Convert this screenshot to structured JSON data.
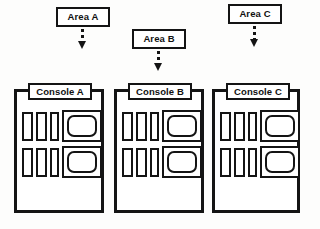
{
  "figure": {
    "kind": "block-diagram",
    "ink_color": "#141414",
    "paper_color": "#fdfdfc"
  },
  "areas": [
    {
      "id": "area-a",
      "label": "Area A",
      "box": {
        "x": 56,
        "y": 7,
        "w": 54,
        "h": 20
      },
      "arrow": {
        "x": 78,
        "y": 29,
        "stem_h": 12,
        "icon": "dashed-down-arrow-icon"
      }
    },
    {
      "id": "area-b",
      "label": "Area B",
      "box": {
        "x": 132,
        "y": 29,
        "w": 54,
        "h": 20
      },
      "arrow": {
        "x": 154,
        "y": 51,
        "stem_h": 12,
        "icon": "dashed-down-arrow-icon"
      }
    },
    {
      "id": "area-c",
      "label": "Area C",
      "box": {
        "x": 228,
        "y": 4,
        "w": 54,
        "h": 20
      },
      "arrow": {
        "x": 250,
        "y": 26,
        "stem_h": 13,
        "icon": "dashed-down-arrow-icon"
      }
    }
  ],
  "consoles": [
    {
      "id": "console-a",
      "label": "Console A",
      "box": {
        "x": 14,
        "y": 89,
        "w": 90,
        "h": 124
      },
      "plate": {
        "x": 28,
        "y": 83,
        "w": 64,
        "h": 17
      },
      "bays": [
        {
          "id": "bay-upper",
          "y": 112,
          "modules": [
            {
              "x": 22,
              "w": 11,
              "h": 29
            },
            {
              "x": 36,
              "w": 11,
              "h": 29
            },
            {
              "x": 50,
              "w": 9,
              "h": 29
            }
          ],
          "monitor": {
            "x": 62,
            "w": 40,
            "h": 32
          }
        },
        {
          "id": "bay-lower",
          "y": 148,
          "modules": [
            {
              "x": 22,
              "w": 11,
              "h": 29
            },
            {
              "x": 36,
              "w": 11,
              "h": 29
            },
            {
              "x": 50,
              "w": 9,
              "h": 29
            }
          ],
          "monitor": {
            "x": 62,
            "w": 40,
            "h": 32
          }
        }
      ]
    },
    {
      "id": "console-b",
      "label": "Console B",
      "box": {
        "x": 114,
        "y": 89,
        "w": 90,
        "h": 124
      },
      "plate": {
        "x": 128,
        "y": 83,
        "w": 64,
        "h": 17
      },
      "bays": [
        {
          "id": "bay-upper",
          "y": 112,
          "modules": [
            {
              "x": 122,
              "w": 11,
              "h": 29
            },
            {
              "x": 136,
              "w": 11,
              "h": 29
            },
            {
              "x": 150,
              "w": 9,
              "h": 29
            }
          ],
          "monitor": {
            "x": 162,
            "w": 40,
            "h": 32
          }
        },
        {
          "id": "bay-lower",
          "y": 148,
          "modules": [
            {
              "x": 122,
              "w": 11,
              "h": 29
            },
            {
              "x": 136,
              "w": 11,
              "h": 29
            },
            {
              "x": 150,
              "w": 9,
              "h": 29
            }
          ],
          "monitor": {
            "x": 162,
            "w": 40,
            "h": 32
          }
        }
      ]
    },
    {
      "id": "console-c",
      "label": "Console C",
      "box": {
        "x": 212,
        "y": 89,
        "w": 88,
        "h": 124
      },
      "plate": {
        "x": 226,
        "y": 83,
        "w": 64,
        "h": 17
      },
      "bays": [
        {
          "id": "bay-upper",
          "y": 112,
          "modules": [
            {
              "x": 220,
              "w": 11,
              "h": 29
            },
            {
              "x": 234,
              "w": 11,
              "h": 29
            },
            {
              "x": 248,
              "w": 9,
              "h": 29
            }
          ],
          "monitor": {
            "x": 260,
            "w": 40,
            "h": 32
          }
        },
        {
          "id": "bay-lower",
          "y": 148,
          "modules": [
            {
              "x": 220,
              "w": 11,
              "h": 29
            },
            {
              "x": 234,
              "w": 11,
              "h": 29
            },
            {
              "x": 248,
              "w": 9,
              "h": 29
            }
          ],
          "monitor": {
            "x": 260,
            "w": 40,
            "h": 32
          }
        }
      ]
    }
  ]
}
